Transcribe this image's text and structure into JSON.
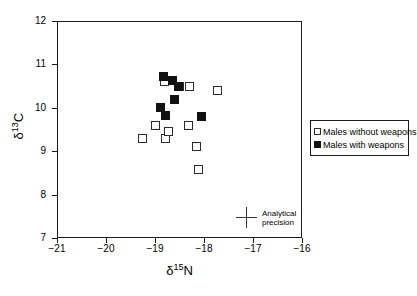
{
  "chart_data": {
    "type": "scatter",
    "title": "",
    "xlabel": "δ 15N",
    "ylabel": "δ 13C",
    "xlim": [
      -21,
      -16
    ],
    "ylim": [
      7,
      12
    ],
    "xticks": [
      -21,
      -20,
      -19,
      -18,
      -17,
      -16
    ],
    "yticks": [
      7,
      8,
      9,
      10,
      11,
      12
    ],
    "xtick_labels": [
      "−21",
      "−20",
      "−19",
      "−18",
      "−17",
      "−16"
    ],
    "ytick_labels": [
      "7",
      "8",
      "9",
      "10",
      "11",
      "12"
    ],
    "grid": false,
    "legend_position": "right-outside",
    "series": [
      {
        "name": "Males without weapons",
        "marker": "open-square",
        "color": "#ffffff",
        "edge_color": "#2b2b2b",
        "points": [
          {
            "x": -19.25,
            "y": 9.3
          },
          {
            "x": -19.0,
            "y": 9.6
          },
          {
            "x": -18.8,
            "y": 10.6
          },
          {
            "x": -18.78,
            "y": 9.3
          },
          {
            "x": -18.72,
            "y": 9.45
          },
          {
            "x": -18.5,
            "y": 10.5
          },
          {
            "x": -18.32,
            "y": 9.6
          },
          {
            "x": -18.3,
            "y": 10.5
          },
          {
            "x": -18.15,
            "y": 9.1
          },
          {
            "x": -18.12,
            "y": 8.58
          },
          {
            "x": -17.72,
            "y": 10.4
          }
        ]
      },
      {
        "name": "Males with weapons",
        "marker": "filled-square",
        "color": "#111111",
        "edge_color": "#111111",
        "points": [
          {
            "x": -18.82,
            "y": 10.72
          },
          {
            "x": -18.88,
            "y": 10.0
          },
          {
            "x": -18.78,
            "y": 9.82
          },
          {
            "x": -18.65,
            "y": 10.62
          },
          {
            "x": -18.6,
            "y": 10.2
          },
          {
            "x": -18.52,
            "y": 10.48
          },
          {
            "x": -18.05,
            "y": 9.8
          }
        ]
      }
    ],
    "annotations": [
      {
        "name": "analytical-precision",
        "type": "error-cross",
        "line1": "Analytical",
        "line2": "precision",
        "x": -17.05,
        "y": 7.28
      }
    ]
  }
}
